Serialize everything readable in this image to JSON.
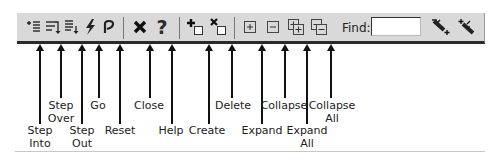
{
  "toolbar": {
    "find_label": "Find:",
    "find_value": "",
    "buttons": [
      {
        "id": "step-into",
        "icon": "step-into-icon"
      },
      {
        "id": "step-over",
        "icon": "step-over-icon"
      },
      {
        "id": "step-out",
        "icon": "step-out-icon"
      },
      {
        "id": "go",
        "icon": "lightning-icon"
      },
      {
        "id": "reset",
        "icon": "undo-arrow-icon"
      },
      {
        "id": "close",
        "icon": "close-x-icon"
      },
      {
        "id": "help",
        "icon": "question-mark-icon"
      },
      {
        "id": "create",
        "icon": "create-node-icon"
      },
      {
        "id": "delete",
        "icon": "delete-node-icon"
      },
      {
        "id": "expand",
        "icon": "plus-box-icon"
      },
      {
        "id": "collapse",
        "icon": "minus-box-icon"
      },
      {
        "id": "expand-all",
        "icon": "expand-all-icon"
      },
      {
        "id": "collapse-all",
        "icon": "collapse-all-icon"
      },
      {
        "id": "find-next",
        "icon": "find-next-icon"
      },
      {
        "id": "find-previous",
        "icon": "find-previous-icon"
      }
    ]
  },
  "callouts": {
    "step_into": [
      "Step",
      "Into"
    ],
    "step_over": [
      "Step",
      "Over"
    ],
    "step_out": [
      "Step",
      "Out"
    ],
    "go": [
      "Go"
    ],
    "reset": [
      "Reset"
    ],
    "close": [
      "Close"
    ],
    "help": [
      "Help"
    ],
    "create": [
      "Create"
    ],
    "delete": [
      "Delete"
    ],
    "expand": [
      "Expand"
    ],
    "collapse": [
      "Collapse"
    ],
    "expand_all": [
      "Expand",
      "All"
    ],
    "collapse_all": [
      "Collapse",
      "All"
    ]
  }
}
